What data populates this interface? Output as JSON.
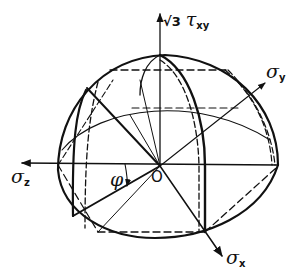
{
  "diagram": {
    "colors": {
      "line": "#111111",
      "background": "#ffffff"
    },
    "axes": {
      "vertical": {
        "symbol": "τ",
        "subscript": "xy",
        "prefix": "√3"
      },
      "y": {
        "symbol": "σ",
        "subscript": "y"
      },
      "z": {
        "symbol": "σ",
        "subscript": "z"
      },
      "x": {
        "symbol": "σ",
        "subscript": "x"
      }
    },
    "origin_label": "O",
    "angle_label": "φ"
  }
}
